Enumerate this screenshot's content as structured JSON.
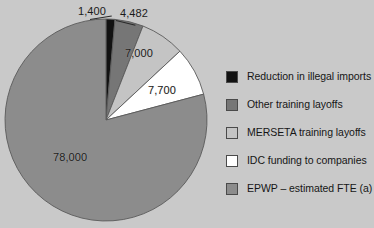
{
  "chart_data": {
    "type": "pie",
    "title": "",
    "subtitle": "",
    "xlabel": "",
    "ylabel": "",
    "legend_position": "right",
    "grid": false,
    "start_angle_deg": 0,
    "direction": "clockwise",
    "total": 98582,
    "categories": [
      "Reduction in illegal imports",
      "Other training layoffs",
      "MERSETA training layoffs",
      "IDC funding to companies",
      "EPWP – estimated FTE (a)"
    ],
    "values": [
      1400,
      4482,
      7000,
      7700,
      78000
    ],
    "value_labels": [
      "1,400",
      "4,482",
      "7,000",
      "7,700",
      "78,000"
    ],
    "colors": [
      "#121212",
      "#767676",
      "#c4c4c4",
      "#ffffff",
      "#8c8c8c"
    ],
    "slices": [
      {
        "label": "Reduction in illegal imports",
        "value": 1400,
        "value_label": "1,400",
        "color": "#121212",
        "start_deg": 0.0,
        "end_deg": 5.11
      },
      {
        "label": "Other training layoffs",
        "value": 4482,
        "value_label": "4,482",
        "color": "#767676",
        "start_deg": 5.11,
        "end_deg": 21.48
      },
      {
        "label": "MERSETA training layoffs",
        "value": 7000,
        "value_label": "7,000",
        "color": "#c4c4c4",
        "start_deg": 21.48,
        "end_deg": 47.05
      },
      {
        "label": "IDC funding to companies",
        "value": 7700,
        "value_label": "7,700",
        "color": "#ffffff",
        "start_deg": 47.05,
        "end_deg": 75.17
      },
      {
        "label": "EPWP – estimated FTE (a)",
        "value": 78000,
        "value_label": "78,000",
        "color": "#8c8c8c",
        "start_deg": 75.17,
        "end_deg": 360.0
      }
    ]
  },
  "labels": {
    "v1": "1,400",
    "v2": "4,482",
    "v3": "7,000",
    "v4": "7,700",
    "v5": "78,000"
  },
  "legend": {
    "items": [
      {
        "label": "Reduction in illegal imports",
        "color": "#121212"
      },
      {
        "label": "Other training layoffs",
        "color": "#767676"
      },
      {
        "label": "MERSETA training layoffs",
        "color": "#c4c4c4"
      },
      {
        "label": "IDC funding to companies",
        "color": "#ffffff"
      },
      {
        "label": "EPWP – estimated FTE (a)",
        "color": "#8c8c8c"
      }
    ]
  },
  "style": {
    "background": "#c9c9c9",
    "outline": "#5a5a5a",
    "text": "#161616"
  }
}
